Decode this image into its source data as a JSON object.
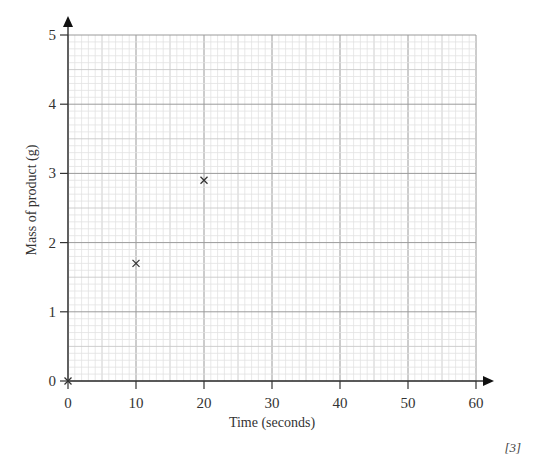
{
  "chart_data": {
    "type": "scatter",
    "title": "",
    "xlabel": "Time (seconds)",
    "ylabel": "Mass of product (g)",
    "xlim": [
      0,
      60
    ],
    "ylim": [
      0,
      5
    ],
    "x_ticks": [
      0,
      10,
      20,
      30,
      40,
      50,
      60
    ],
    "y_ticks": [
      0,
      1,
      2,
      3,
      4,
      5
    ],
    "grid": true,
    "grid_minor_x": 1,
    "grid_minor_y": 0.1,
    "grid_medium_x": 5,
    "grid_medium_y": 0.5,
    "marker": "x",
    "series": [
      {
        "name": "Mass of product",
        "x": [
          0,
          10,
          20
        ],
        "y": [
          0,
          1.7,
          2.9
        ]
      }
    ]
  },
  "labels": {
    "xlabel": "Time (seconds)",
    "ylabel": "Mass of product (g)",
    "marks": "[3]"
  },
  "colors": {
    "axis": "#333333",
    "grid_minor": "#e2e2e2",
    "grid_medium": "#c8c8c8",
    "grid_major": "#9a9a9a",
    "marker": "#333333"
  }
}
